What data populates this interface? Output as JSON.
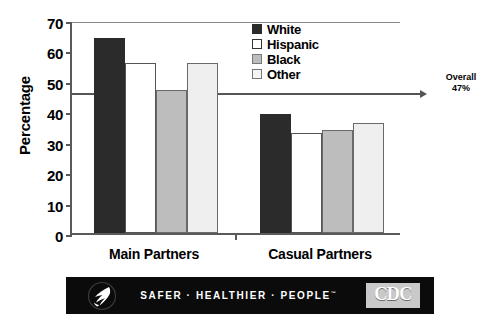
{
  "chart_data": {
    "type": "bar",
    "title": "",
    "xlabel": "",
    "ylabel": "Percentage",
    "categories": [
      "Main Partners",
      "Casual Partners"
    ],
    "series": [
      {
        "name": "White",
        "values": [
          64,
          39
        ],
        "color": "#2b2b2b"
      },
      {
        "name": "Hispanic",
        "values": [
          56,
          33
        ],
        "color": "#ffffff"
      },
      {
        "name": "Black",
        "values": [
          47,
          34
        ],
        "color": "#bdbdbd"
      },
      {
        "name": "Other",
        "values": [
          56,
          36
        ],
        "color": "#efefef"
      }
    ],
    "ylim": [
      0,
      70
    ],
    "yticks": [
      0,
      10,
      20,
      30,
      40,
      50,
      60,
      70
    ],
    "grid": false,
    "legend_position": "top-right",
    "annotations": [
      {
        "name": "overall-reference-line",
        "value": 47,
        "label_line1": "Overall",
        "label_line2": "47%"
      }
    ]
  },
  "axis": {
    "ytitle": "Percentage",
    "ticks": [
      "70",
      "60",
      "50",
      "40",
      "30",
      "20",
      "10",
      "0"
    ],
    "xlabels": [
      "Main Partners",
      "Casual Partners"
    ]
  },
  "legend": {
    "items": [
      {
        "label": "White"
      },
      {
        "label": "Hispanic"
      },
      {
        "label": "Black"
      },
      {
        "label": "Other"
      }
    ]
  },
  "overall": {
    "line1": "Overall",
    "line2": "47%"
  },
  "banner": {
    "tagline": "SAFER · HEALTHIER · PEOPLE",
    "trademark": "™",
    "cdc": "CDC"
  }
}
